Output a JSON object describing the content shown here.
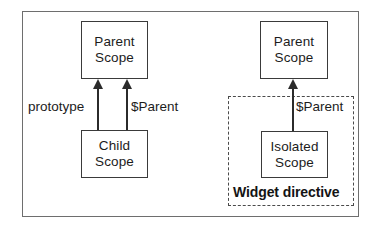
{
  "diagram": {
    "type": "flow-diagram",
    "nodes": [
      {
        "id": "parent-scope-left",
        "line1": "Parent",
        "line2": "Scope"
      },
      {
        "id": "child-scope",
        "line1": "Child",
        "line2": "Scope"
      },
      {
        "id": "parent-scope-right",
        "line1": "Parent",
        "line2": "Scope"
      },
      {
        "id": "isolated-scope",
        "line1": "Isolated",
        "line2": "Scope"
      }
    ],
    "edges": [
      {
        "id": "arrow-prototype",
        "label": "prototype",
        "from": "child-scope",
        "to": "parent-scope-left",
        "direction": "up"
      },
      {
        "id": "arrow-parent-left",
        "label": "$Parent",
        "from": "child-scope",
        "to": "parent-scope-left",
        "direction": "up"
      },
      {
        "id": "arrow-parent-right",
        "label": "$Parent",
        "from": "isolated-scope",
        "to": "parent-scope-right",
        "direction": "up"
      }
    ],
    "regions": [
      {
        "id": "widget-directive",
        "caption": "Widget directive",
        "style": "dashed"
      }
    ],
    "colors": {
      "frame": "#6e6e6e",
      "node_border": "#3a3a3a",
      "dashed_border": "#4a4a4a",
      "arrow": "#2b2b2b",
      "text": "#1c1c1c",
      "background": "#ffffff"
    }
  }
}
